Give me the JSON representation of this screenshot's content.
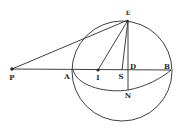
{
  "figure": {
    "type": "geometric diagram",
    "stroke_color": "#2a2a2a",
    "background": "#ffffff",
    "circle": {
      "cx": 122,
      "cy": 71,
      "r": 50
    },
    "points": {
      "P": {
        "x": 12,
        "y": 69,
        "label": "P",
        "label_x": 12,
        "label_y": 77
      },
      "A": {
        "x": 73,
        "y": 70,
        "label": "A",
        "label_x": 68,
        "label_y": 76
      },
      "I": {
        "x": 98,
        "y": 70,
        "label": "I",
        "label_x": 98,
        "label_y": 77
      },
      "S": {
        "x": 122,
        "y": 70,
        "label": "S",
        "label_x": 121,
        "label_y": 76
      },
      "D": {
        "x": 128,
        "y": 70,
        "label": "D",
        "label_x": 133,
        "label_y": 66
      },
      "B": {
        "x": 171,
        "y": 70,
        "label": "B",
        "label_x": 168,
        "label_y": 66
      },
      "E": {
        "x": 128,
        "y": 20,
        "label": "E",
        "label_x": 128,
        "label_y": 13
      },
      "N": {
        "x": 128,
        "y": 90,
        "label": "N",
        "label_x": 128,
        "label_y": 95
      }
    },
    "segments": [
      [
        "P",
        "B"
      ],
      [
        "P",
        "E"
      ],
      [
        "I",
        "E"
      ],
      [
        "S",
        "E"
      ],
      [
        "E",
        "N"
      ]
    ],
    "curve": {
      "from": "A",
      "through": "N",
      "to": "B"
    }
  }
}
